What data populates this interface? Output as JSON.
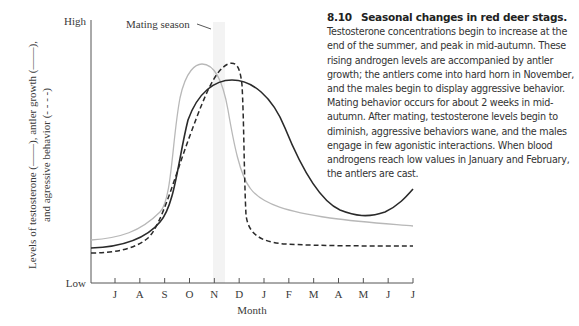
{
  "figure": {
    "number": "8.10",
    "title": "Seasonal changes in red deer stags.",
    "caption_body": "Testosterone concentrations begin to increase at the end of the summer, and peak in mid-autumn. These rising androgen levels are accompanied by antler growth; the antlers come into hard horn in November, and the males begin to display aggressive behavior. Mating behavior occurs for about 2 weeks in mid-autumn. After mating, testosterone levels begin to diminish, aggressive behaviors wane, and the males engage in few agonistic interactions. When blood androgens reach low values in January and February, the antlers are cast."
  },
  "chart_data": {
    "type": "line",
    "title": "Seasonal changes in red deer stags",
    "xlabel": "Month",
    "ylabel_line1": "Levels of testosterone (——), antler growth (——),",
    "ylabel_line2": "and agressive behavior (- - - -)",
    "y_tick_labels": {
      "high": "High",
      "low": "Low"
    },
    "annotation": "Mating season",
    "categories": [
      "J",
      "A",
      "S",
      "O",
      "N",
      "D",
      "J",
      "F",
      "M",
      "A",
      "M",
      "J",
      "J"
    ],
    "ylim": [
      0,
      100
    ],
    "grid": false,
    "legend_position": "in y-axis label",
    "series": [
      {
        "name": "Testosterone",
        "style": "solid-light-gray",
        "color": "#b5b5b5",
        "values": [
          32,
          36,
          52,
          95,
          85,
          38,
          25,
          22,
          21,
          20,
          20,
          19,
          19
        ]
      },
      {
        "name": "Antler growth",
        "style": "solid-black",
        "color": "#2a2a2a",
        "values": [
          28,
          31,
          44,
          78,
          88,
          86,
          70,
          45,
          25,
          16,
          14,
          20,
          34
        ]
      },
      {
        "name": "Aggressive behavior",
        "style": "dashed-black",
        "color": "#2a2a2a",
        "values": [
          24,
          26,
          36,
          62,
          90,
          93,
          22,
          16,
          16,
          16,
          16,
          16,
          16
        ]
      }
    ],
    "mating_season_band": {
      "start_month_index": 4.0,
      "end_month_index": 4.5
    }
  }
}
